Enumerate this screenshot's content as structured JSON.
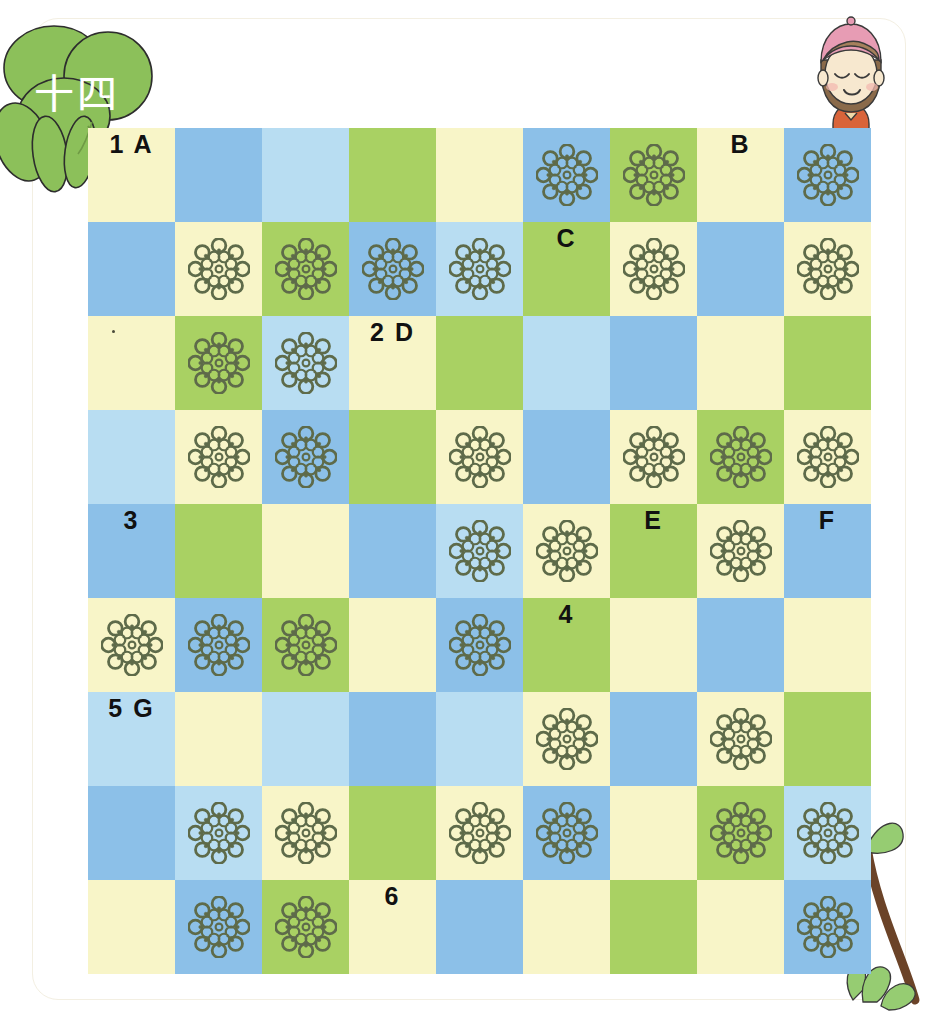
{
  "page": {
    "lesson_number": "十四",
    "background_color": "#ffffff",
    "frame_color": "#f3efe2"
  },
  "palette": {
    "cream": "#f8f5c8",
    "blue": "#8cc0e8",
    "lightblue": "#b8ddf2",
    "green": "#a9d163",
    "motif": "#5e6b4a",
    "label_text": "#111111",
    "clover_green": "#8cc05a",
    "hat_pink": "#e79cb4",
    "hair_brown": "#8a6a4a",
    "skin": "#f7e8cf",
    "shirt_orange": "#d9643a",
    "stem_brown": "#6b4328",
    "leaf_green": "#96cc72"
  },
  "decorations": {
    "clover_badge": "clover-badge-icon",
    "girl": "girl-illustration-icon",
    "plant": "plant-sprout-icon"
  },
  "grid": {
    "rows": 9,
    "columns": 9,
    "cells": [
      [
        {
          "color": "cream",
          "label": "1 A",
          "flower": false,
          "dot": false
        },
        {
          "color": "blue",
          "label": "",
          "flower": false,
          "dot": false
        },
        {
          "color": "lightblue",
          "label": "",
          "flower": false,
          "dot": false
        },
        {
          "color": "green",
          "label": "",
          "flower": false,
          "dot": false
        },
        {
          "color": "cream",
          "label": "",
          "flower": false,
          "dot": false
        },
        {
          "color": "blue",
          "label": "",
          "flower": true,
          "dot": false
        },
        {
          "color": "green",
          "label": "",
          "flower": true,
          "dot": false
        },
        {
          "color": "cream",
          "label": "B",
          "flower": false,
          "dot": false
        },
        {
          "color": "blue",
          "label": "",
          "flower": true,
          "dot": false
        }
      ],
      [
        {
          "color": "blue",
          "label": "",
          "flower": false,
          "dot": false
        },
        {
          "color": "cream",
          "label": "",
          "flower": true,
          "dot": false
        },
        {
          "color": "green",
          "label": "",
          "flower": true,
          "dot": false
        },
        {
          "color": "blue",
          "label": "",
          "flower": true,
          "dot": false
        },
        {
          "color": "lightblue",
          "label": "",
          "flower": true,
          "dot": false
        },
        {
          "color": "green",
          "label": "C",
          "flower": false,
          "dot": false
        },
        {
          "color": "cream",
          "label": "",
          "flower": true,
          "dot": false
        },
        {
          "color": "blue",
          "label": "",
          "flower": false,
          "dot": false
        },
        {
          "color": "cream",
          "label": "",
          "flower": true,
          "dot": false
        }
      ],
      [
        {
          "color": "cream",
          "label": "",
          "flower": false,
          "dot": true
        },
        {
          "color": "green",
          "label": "",
          "flower": true,
          "dot": false
        },
        {
          "color": "lightblue",
          "label": "",
          "flower": true,
          "dot": false
        },
        {
          "color": "cream",
          "label": "2 D",
          "flower": false,
          "dot": false
        },
        {
          "color": "green",
          "label": "",
          "flower": false,
          "dot": false
        },
        {
          "color": "lightblue",
          "label": "",
          "flower": false,
          "dot": false
        },
        {
          "color": "blue",
          "label": "",
          "flower": false,
          "dot": false
        },
        {
          "color": "cream",
          "label": "",
          "flower": false,
          "dot": false
        },
        {
          "color": "green",
          "label": "",
          "flower": false,
          "dot": false
        }
      ],
      [
        {
          "color": "lightblue",
          "label": "",
          "flower": false,
          "dot": false
        },
        {
          "color": "cream",
          "label": "",
          "flower": true,
          "dot": false
        },
        {
          "color": "blue",
          "label": "",
          "flower": true,
          "dot": false
        },
        {
          "color": "green",
          "label": "",
          "flower": false,
          "dot": false
        },
        {
          "color": "cream",
          "label": "",
          "flower": true,
          "dot": false
        },
        {
          "color": "blue",
          "label": "",
          "flower": false,
          "dot": false
        },
        {
          "color": "cream",
          "label": "",
          "flower": true,
          "dot": false
        },
        {
          "color": "green",
          "label": "",
          "flower": true,
          "dot": false
        },
        {
          "color": "cream",
          "label": "",
          "flower": true,
          "dot": false
        }
      ],
      [
        {
          "color": "blue",
          "label": "3",
          "flower": false,
          "dot": false
        },
        {
          "color": "green",
          "label": "",
          "flower": false,
          "dot": false
        },
        {
          "color": "cream",
          "label": "",
          "flower": false,
          "dot": false
        },
        {
          "color": "blue",
          "label": "",
          "flower": false,
          "dot": false
        },
        {
          "color": "lightblue",
          "label": "",
          "flower": true,
          "dot": false
        },
        {
          "color": "cream",
          "label": "",
          "flower": true,
          "dot": false
        },
        {
          "color": "green",
          "label": "E",
          "flower": false,
          "dot": false
        },
        {
          "color": "cream",
          "label": "",
          "flower": true,
          "dot": false
        },
        {
          "color": "blue",
          "label": "F",
          "flower": false,
          "dot": false
        }
      ],
      [
        {
          "color": "cream",
          "label": "",
          "flower": true,
          "dot": false
        },
        {
          "color": "blue",
          "label": "",
          "flower": true,
          "dot": false
        },
        {
          "color": "green",
          "label": "",
          "flower": true,
          "dot": false
        },
        {
          "color": "cream",
          "label": "",
          "flower": false,
          "dot": false
        },
        {
          "color": "blue",
          "label": "",
          "flower": true,
          "dot": false
        },
        {
          "color": "green",
          "label": "4",
          "flower": false,
          "dot": false
        },
        {
          "color": "cream",
          "label": "",
          "flower": false,
          "dot": false
        },
        {
          "color": "blue",
          "label": "",
          "flower": false,
          "dot": false
        },
        {
          "color": "cream",
          "label": "",
          "flower": false,
          "dot": false
        }
      ],
      [
        {
          "color": "lightblue",
          "label": "5 G",
          "flower": false,
          "dot": false
        },
        {
          "color": "cream",
          "label": "",
          "flower": false,
          "dot": false
        },
        {
          "color": "lightblue",
          "label": "",
          "flower": false,
          "dot": false
        },
        {
          "color": "blue",
          "label": "",
          "flower": false,
          "dot": false
        },
        {
          "color": "lightblue",
          "label": "",
          "flower": false,
          "dot": false
        },
        {
          "color": "cream",
          "label": "",
          "flower": true,
          "dot": false
        },
        {
          "color": "blue",
          "label": "",
          "flower": false,
          "dot": false
        },
        {
          "color": "cream",
          "label": "",
          "flower": true,
          "dot": false
        },
        {
          "color": "green",
          "label": "",
          "flower": false,
          "dot": false
        }
      ],
      [
        {
          "color": "blue",
          "label": "",
          "flower": false,
          "dot": false
        },
        {
          "color": "lightblue",
          "label": "",
          "flower": true,
          "dot": false
        },
        {
          "color": "cream",
          "label": "",
          "flower": true,
          "dot": false
        },
        {
          "color": "green",
          "label": "",
          "flower": false,
          "dot": false
        },
        {
          "color": "cream",
          "label": "",
          "flower": true,
          "dot": false
        },
        {
          "color": "blue",
          "label": "",
          "flower": true,
          "dot": false
        },
        {
          "color": "cream",
          "label": "",
          "flower": false,
          "dot": false
        },
        {
          "color": "green",
          "label": "",
          "flower": true,
          "dot": false
        },
        {
          "color": "lightblue",
          "label": "",
          "flower": true,
          "dot": false
        }
      ],
      [
        {
          "color": "cream",
          "label": "",
          "flower": false,
          "dot": false
        },
        {
          "color": "blue",
          "label": "",
          "flower": true,
          "dot": false
        },
        {
          "color": "green",
          "label": "",
          "flower": true,
          "dot": false
        },
        {
          "color": "cream",
          "label": "6",
          "flower": false,
          "dot": false
        },
        {
          "color": "blue",
          "label": "",
          "flower": false,
          "dot": false
        },
        {
          "color": "cream",
          "label": "",
          "flower": false,
          "dot": false
        },
        {
          "color": "green",
          "label": "",
          "flower": false,
          "dot": false
        },
        {
          "color": "cream",
          "label": "",
          "flower": false,
          "dot": false
        },
        {
          "color": "blue",
          "label": "",
          "flower": true,
          "dot": false
        }
      ]
    ]
  }
}
